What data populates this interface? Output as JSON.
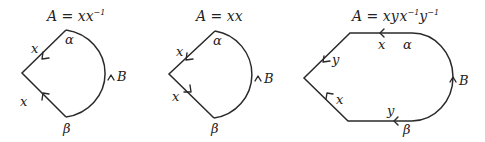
{
  "diagrams": [
    {
      "title_prefix": "A = ",
      "title_word": "xx",
      "title_sup": "−1",
      "edge_labels": {
        "top_left": "x",
        "bottom_left": "x",
        "arc": "B"
      },
      "vertex_labels": {
        "top": "α",
        "bottom": "β"
      }
    },
    {
      "title_prefix": "A = ",
      "title_word": "xx",
      "edge_labels": {
        "top_left": "x",
        "bottom_left": "x",
        "arc": "B"
      },
      "vertex_labels": {
        "top": "α",
        "bottom": "β"
      }
    },
    {
      "title_prefix": "A = ",
      "title_parts": [
        "xy",
        "x",
        "−1",
        "y",
        "−1"
      ],
      "edge_labels": {
        "top": "x",
        "upper_left": "y",
        "lower_left": "x",
        "bottom": "y",
        "arc": "B"
      },
      "vertex_labels": {
        "top": "α",
        "bottom": "β"
      }
    }
  ]
}
